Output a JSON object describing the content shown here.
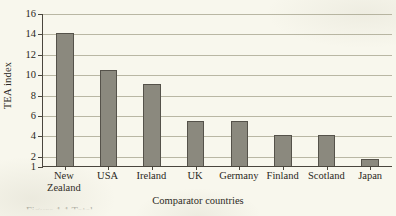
{
  "chart_data": {
    "type": "bar",
    "title": "",
    "xlabel": "Comparator countries",
    "ylabel": "TEA index",
    "categories": [
      "New Zealand",
      "USA",
      "Ireland",
      "UK",
      "Germany",
      "Finland",
      "Scotland",
      "Japan"
    ],
    "values": [
      14.0,
      10.4,
      9.0,
      5.4,
      5.4,
      4.0,
      4.0,
      1.7
    ],
    "yticks": [
      1,
      2,
      4,
      6,
      8,
      10,
      12,
      14,
      16
    ],
    "ytick_labels": [
      "1",
      "2",
      "4",
      "6",
      "8",
      "10",
      "12",
      "14",
      "16"
    ],
    "ylim": [
      1,
      16
    ],
    "grid": "horizontal",
    "legend": "none",
    "bar_color": "#8b897e",
    "bar_edge_color": "#55524a",
    "background_color": "#f8f7ed",
    "axis_color": "#4a463d",
    "gridline_color": "#b9b7a4"
  },
  "caption": {
    "text": "Figure 1.1  Total"
  }
}
